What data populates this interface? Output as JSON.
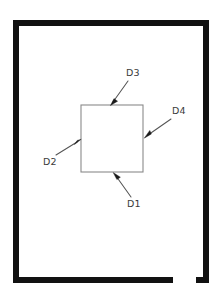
{
  "drawing": {
    "background_color": "#ffffff",
    "frame": {
      "name": "outer-border-frame",
      "color": "#111111",
      "thickness": 6,
      "left": 13,
      "top": 20,
      "right": 209,
      "bottom": 283,
      "gap_note": "break in bottom edge near right corner",
      "gap_start_x": 173,
      "gap_end_x": 196
    },
    "inner_square": {
      "name": "center-square",
      "stroke_color": "#8a8a8a",
      "x": 81,
      "y": 105,
      "width": 62,
      "height": 67
    },
    "dimensions": [
      {
        "id": "D1",
        "label": "D1",
        "label_x": 127,
        "label_y": 207,
        "edge": "bottom",
        "tail_x": 131,
        "tail_y": 197,
        "tip_x": 114,
        "tip_y": 174,
        "angle_deg": 234
      },
      {
        "id": "D2",
        "label": "D2",
        "label_x": 43,
        "label_y": 165,
        "edge": "left",
        "tail_x": 56,
        "tail_y": 155,
        "tip_x": 80,
        "tip_y": 140,
        "angle_deg": 328
      },
      {
        "id": "D3",
        "label": "D3",
        "label_x": 126,
        "label_y": 76,
        "edge": "top",
        "tail_x": 128,
        "tail_y": 81,
        "tip_x": 111,
        "tip_y": 104,
        "angle_deg": 126
      },
      {
        "id": "D4",
        "label": "D4",
        "label_x": 172,
        "label_y": 114,
        "edge": "right",
        "tail_x": 171,
        "tail_y": 119,
        "tip_x": 145,
        "tip_y": 137,
        "angle_deg": 145
      }
    ]
  }
}
